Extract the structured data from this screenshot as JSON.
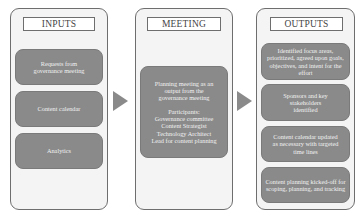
{
  "diagram": {
    "panels": [
      {
        "id": "inputs",
        "title": "INPUTS",
        "cards": [
          {
            "lines": [
              "Requests from",
              "governance meeting"
            ]
          },
          {
            "lines": [
              "Content calendar"
            ]
          },
          {
            "lines": [
              "Analytics"
            ]
          }
        ]
      },
      {
        "id": "meeting",
        "title": "MEETING",
        "cards": [
          {
            "lines": [
              "Planning meeting as an",
              "output from the",
              "governance meeting"
            ],
            "lines2": [
              "Participants:",
              "Governance committee",
              "Content Strategist",
              "Technology Architect",
              "Lead for content planning"
            ]
          }
        ]
      },
      {
        "id": "outputs",
        "title": "OUTPUTS",
        "cards": [
          {
            "lines": [
              "Identified focus areas,",
              "prioritized, agreed upon goals,",
              "objectives, and intent for the",
              "effort"
            ]
          },
          {
            "lines": [
              "Sponsors and key",
              "stakeholders",
              "identified"
            ]
          },
          {
            "lines": [
              "Content calendar updated",
              "as necessary with targeted",
              "time lines"
            ]
          },
          {
            "lines": [
              "Content planning kicked-off for",
              "scoping, planning, and tracking"
            ]
          }
        ]
      }
    ],
    "arrows": [
      {
        "from": "inputs",
        "to": "meeting"
      },
      {
        "from": "meeting",
        "to": "outputs"
      }
    ],
    "colors": {
      "panel_fill": "#f4f4f4",
      "panel_border": "#6e6e6e",
      "card_fill": "#8a8a8a",
      "card_text": "#f2f2f2",
      "arrow": "#8a8a8a"
    }
  }
}
